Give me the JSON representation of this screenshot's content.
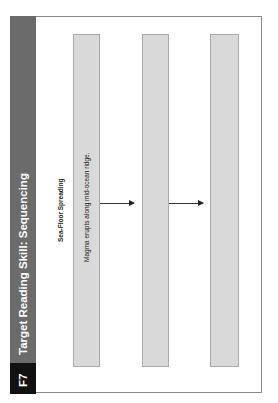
{
  "header": {
    "code": "F7",
    "title": "Target Reading Skill: Sequencing"
  },
  "organizer": {
    "title": "Sea-Floor Spreading",
    "steps": [
      {
        "text": "Magma erupts along mid-ocean ridge."
      },
      {
        "text": ""
      },
      {
        "text": ""
      }
    ]
  },
  "colors": {
    "header_bar": "#6b6b6b",
    "code_box": "#111111",
    "step_box": "#d9d9d9"
  }
}
